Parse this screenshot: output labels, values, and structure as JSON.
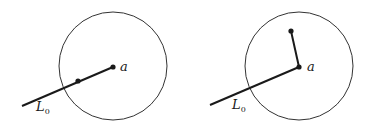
{
  "diagrams": [
    {
      "name": "left",
      "circle": {
        "cx": 113,
        "cy": 66,
        "r": 54
      },
      "center_label": "a",
      "ray_label": "L",
      "ray_label_sub": "0",
      "ray": {
        "x1": 22,
        "y1": 106,
        "x2": 113,
        "y2": 67
      },
      "points": [
        {
          "x": 113,
          "y": 67
        },
        {
          "x": 78,
          "y": 81
        }
      ]
    },
    {
      "name": "right",
      "circle": {
        "cx": 299,
        "cy": 66,
        "r": 54
      },
      "center_label": "a",
      "ray_label": "L",
      "ray_label_sub": "0",
      "ray": {
        "x1": 210,
        "y1": 105,
        "x2": 299,
        "y2": 67
      },
      "branch": {
        "x1": 299,
        "y1": 67,
        "x2": 291,
        "y2": 31
      },
      "points": [
        {
          "x": 299,
          "y": 67
        },
        {
          "x": 291,
          "y": 31
        }
      ]
    }
  ],
  "colors": {
    "stroke": "#1a1a1a",
    "circle": "#333333"
  }
}
